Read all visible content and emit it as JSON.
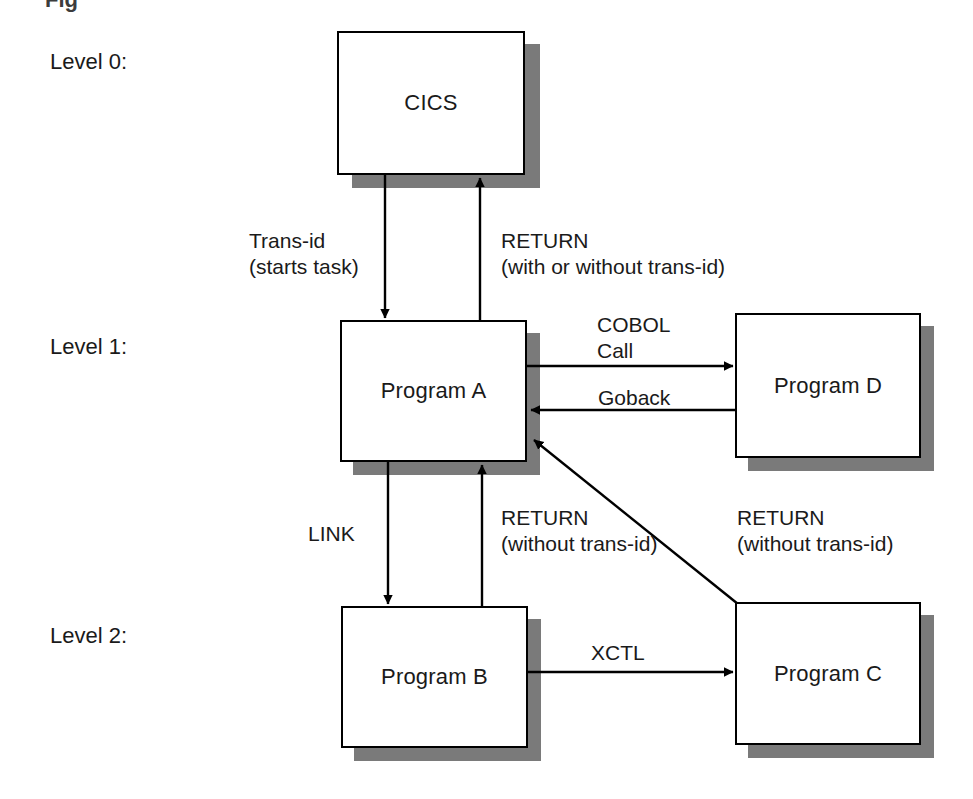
{
  "diagram": {
    "title_fragment": "Fig",
    "levels": [
      {
        "id": "level-0",
        "label": "Level 0:"
      },
      {
        "id": "level-1",
        "label": "Level 1:"
      },
      {
        "id": "level-2",
        "label": "Level 2:"
      }
    ],
    "nodes": [
      {
        "id": "cics",
        "label": "CICS"
      },
      {
        "id": "program-a",
        "label": "Program A"
      },
      {
        "id": "program-d",
        "label": "Program D"
      },
      {
        "id": "program-b",
        "label": "Program B"
      },
      {
        "id": "program-c",
        "label": "Program C"
      }
    ],
    "edges": [
      {
        "id": "cics-to-a",
        "from": "cics",
        "to": "program-a",
        "label_line1": "Trans-id",
        "label_line2": "(starts task)"
      },
      {
        "id": "a-to-cics",
        "from": "program-a",
        "to": "cics",
        "label_line1": "RETURN",
        "label_line2": "(with or without trans-id)"
      },
      {
        "id": "a-to-d",
        "from": "program-a",
        "to": "program-d",
        "label_line1": "COBOL",
        "label_line2": "Call"
      },
      {
        "id": "d-to-a",
        "from": "program-d",
        "to": "program-a",
        "label_line1": "Goback",
        "label_line2": ""
      },
      {
        "id": "a-to-b",
        "from": "program-a",
        "to": "program-b",
        "label_line1": "LINK",
        "label_line2": ""
      },
      {
        "id": "b-to-a",
        "from": "program-b",
        "to": "program-a",
        "label_line1": "RETURN",
        "label_line2": "(without trans-id)"
      },
      {
        "id": "c-to-a",
        "from": "program-c",
        "to": "program-a",
        "label_line1": "RETURN",
        "label_line2": "(without trans-id)"
      },
      {
        "id": "b-to-c",
        "from": "program-b",
        "to": "program-c",
        "label_line1": "XCTL",
        "label_line2": ""
      }
    ],
    "colors": {
      "background": "#ffffff",
      "box_fill": "#ffffff",
      "box_stroke": "#000000",
      "shadow": "#7a7a7a",
      "text": "#1a1a1a",
      "arrow": "#000000"
    }
  }
}
